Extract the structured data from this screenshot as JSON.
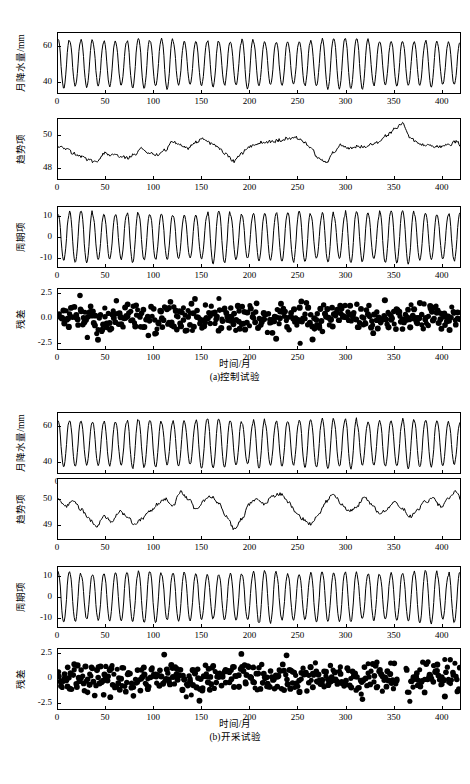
{
  "figure": {
    "subfigures": [
      {
        "id": "a",
        "caption": "(a)控制试验",
        "xaxis_title": "时间/月",
        "xticks": [
          "0",
          "50",
          "100",
          "150",
          "200",
          "250",
          "300",
          "350",
          "400"
        ],
        "xlim": [
          0,
          420
        ],
        "panels": [
          {
            "key": "precip",
            "ylabel": "月降水量/mm",
            "yticks": [
              "60",
              "40"
            ],
            "ytick_values": [
              60,
              40
            ],
            "ylim": [
              33,
              68
            ]
          },
          {
            "key": "trend",
            "ylabel": "趋势项",
            "yticks": [
              "50",
              "48"
            ],
            "ytick_values": [
              50,
              48
            ],
            "ylim": [
              47.3,
              51.0
            ]
          },
          {
            "key": "seasonal",
            "ylabel": "周期项",
            "yticks": [
              "10",
              "0",
              "-10"
            ],
            "ytick_values": [
              10,
              0,
              -10
            ],
            "ylim": [
              -15,
              15
            ]
          },
          {
            "key": "residual",
            "ylabel": "残差",
            "yticks": [
              "2.5",
              "0.0",
              "-2.5"
            ],
            "ytick_values": [
              2.5,
              0.0,
              -2.5
            ],
            "ylim": [
              -3.2,
              3.0
            ]
          }
        ]
      },
      {
        "id": "b",
        "caption": "(b)开采试验",
        "xaxis_title": "时间/月",
        "xticks": [
          "0",
          "50",
          "100",
          "150",
          "200",
          "250",
          "300",
          "350",
          "400"
        ],
        "xlim": [
          0,
          420
        ],
        "panels": [
          {
            "key": "precip",
            "ylabel": "月降水量/mm",
            "yticks": [
              "60",
              "40"
            ],
            "ytick_values": [
              60,
              40
            ],
            "ylim": [
              33,
              68
            ]
          },
          {
            "key": "trend",
            "ylabel": "趋势项",
            "yticks": [
              "50",
              "49"
            ],
            "ytick_values": [
              50,
              49
            ],
            "ylim": [
              48.4,
              50.8
            ]
          },
          {
            "key": "seasonal",
            "ylabel": "周期项",
            "yticks": [
              "10",
              "0",
              "-10"
            ],
            "ytick_values": [
              10,
              0,
              -10
            ],
            "ylim": [
              -15,
              15
            ]
          },
          {
            "key": "residual",
            "ylabel": "残差",
            "yticks": [
              "2.5",
              "0",
              "-2.5"
            ],
            "ytick_values": [
              2.5,
              0,
              -2.5
            ],
            "ylim": [
              -3.2,
              3.0
            ]
          }
        ]
      }
    ]
  },
  "chart_data": [
    {
      "type": "line",
      "id": "a-precip",
      "title": "",
      "xlabel": "时间/月",
      "ylabel": "月降水量/mm",
      "xlim": [
        0,
        420
      ],
      "ylim": [
        33,
        68
      ],
      "grid": false,
      "description": "Monthly precipitation series, control experiment: strong 12-month seasonal oscillation between about 37 and 65 mm, roughly 35 cycles.",
      "seasonal_period": 12,
      "series": [
        {
          "name": "月降水量",
          "amplitude": 13.5,
          "mean": 50.2,
          "cycles": 35,
          "min": 36.5,
          "max": 65.5
        }
      ]
    },
    {
      "type": "line",
      "id": "a-trend",
      "xlabel": "时间/月",
      "ylabel": "趋势项",
      "xlim": [
        0,
        420
      ],
      "ylim": [
        47.3,
        51.0
      ],
      "grid": false,
      "description": "Trend component, control experiment: fluctuates near 49-50 with a dip around month 35, rises to local peaks near 130 and a pronounced maximum near month 360.",
      "series": [
        {
          "name": "趋势项",
          "x": [
            0,
            8,
            16,
            24,
            32,
            40,
            48,
            56,
            64,
            72,
            80,
            88,
            96,
            104,
            112,
            120,
            128,
            136,
            144,
            152,
            160,
            168,
            176,
            184,
            192,
            200,
            208,
            216,
            224,
            232,
            240,
            248,
            256,
            264,
            272,
            280,
            288,
            296,
            304,
            312,
            320,
            328,
            336,
            344,
            352,
            360,
            368,
            376,
            384,
            392,
            400,
            408,
            416
          ],
          "values": [
            49.3,
            49.2,
            48.9,
            48.7,
            48.5,
            48.3,
            48.9,
            48.8,
            48.7,
            48.6,
            48.8,
            49.2,
            48.9,
            48.8,
            49.1,
            49.6,
            49.4,
            49.2,
            49.6,
            49.8,
            49.5,
            49.2,
            48.8,
            48.4,
            48.9,
            49.3,
            49.5,
            49.6,
            49.6,
            49.7,
            49.8,
            49.9,
            49.6,
            49.2,
            48.6,
            48.3,
            49.0,
            49.4,
            49.2,
            49.3,
            49.3,
            49.5,
            49.6,
            50.0,
            50.4,
            50.7,
            49.8,
            49.5,
            49.4,
            49.3,
            49.3,
            49.4,
            49.6
          ]
        }
      ]
    },
    {
      "type": "line",
      "id": "a-seasonal",
      "xlabel": "时间/月",
      "ylabel": "周期项",
      "xlim": [
        0,
        420
      ],
      "ylim": [
        -15,
        15
      ],
      "grid": false,
      "description": "Periodic (seasonal) component, control experiment: regular 12-month cycle oscillating between about -12 and +12.",
      "seasonal_period": 12,
      "series": [
        {
          "name": "周期项",
          "amplitude": 12,
          "mean": 0,
          "cycles": 35,
          "min": -12,
          "max": 12
        }
      ]
    },
    {
      "type": "scatter",
      "id": "a-residual",
      "xlabel": "时间/月",
      "ylabel": "残差",
      "xlim": [
        0,
        420
      ],
      "ylim": [
        -3.2,
        3.0
      ],
      "grid": false,
      "description": "Residual component, control experiment: dense cloud of about 420 points scattered around zero, mostly within ±1.5, a few outliers reaching ±2.5.",
      "n_points": 420,
      "spread": 0.85,
      "mean": 0
    },
    {
      "type": "line",
      "id": "b-precip",
      "xlabel": "时间/月",
      "ylabel": "月降水量/mm",
      "xlim": [
        0,
        420
      ],
      "ylim": [
        33,
        68
      ],
      "grid": false,
      "description": "Monthly precipitation series, extraction experiment: strong 12-month seasonal oscillation between about 37 and 65 mm, roughly 35 cycles.",
      "seasonal_period": 12,
      "series": [
        {
          "name": "月降水量",
          "amplitude": 13.5,
          "mean": 50.2,
          "cycles": 35,
          "min": 36.5,
          "max": 65.5
        }
      ]
    },
    {
      "type": "line",
      "id": "b-trend",
      "xlabel": "时间/月",
      "ylabel": "趋势项",
      "xlim": [
        0,
        420
      ],
      "ylim": [
        48.4,
        50.8
      ],
      "grid": false,
      "description": "Trend component, extraction experiment: noisier than control, oscillating between about 48.7 and 50.4 with a maximum near month 125 and a deep minimum near month 185.",
      "series": [
        {
          "name": "趋势项",
          "x": [
            0,
            8,
            16,
            24,
            32,
            40,
            48,
            56,
            64,
            72,
            80,
            88,
            96,
            104,
            112,
            120,
            128,
            136,
            144,
            152,
            160,
            168,
            176,
            184,
            192,
            200,
            208,
            216,
            224,
            232,
            240,
            248,
            256,
            264,
            272,
            280,
            288,
            296,
            304,
            312,
            320,
            328,
            336,
            344,
            352,
            360,
            368,
            376,
            384,
            392,
            400,
            408,
            416
          ],
          "values": [
            50.0,
            49.7,
            49.9,
            49.6,
            49.2,
            48.9,
            49.3,
            49.1,
            49.5,
            49.3,
            49.0,
            49.2,
            49.5,
            49.8,
            50.0,
            49.7,
            50.3,
            50.0,
            49.6,
            49.9,
            50.1,
            49.8,
            49.3,
            48.8,
            49.2,
            49.8,
            50.0,
            49.8,
            50.1,
            50.2,
            49.9,
            49.5,
            49.2,
            49.0,
            49.4,
            49.9,
            50.2,
            49.8,
            49.5,
            49.7,
            50.1,
            49.8,
            49.4,
            49.6,
            49.9,
            49.6,
            49.3,
            49.6,
            49.9,
            50.0,
            49.7,
            50.0,
            50.3
          ]
        }
      ]
    },
    {
      "type": "line",
      "id": "b-seasonal",
      "xlabel": "时间/月",
      "ylabel": "周期项",
      "xlim": [
        0,
        420
      ],
      "ylim": [
        -15,
        15
      ],
      "grid": false,
      "description": "Periodic (seasonal) component, extraction experiment: regular 12-month cycle oscillating between about -12 and +12.",
      "seasonal_period": 12,
      "series": [
        {
          "name": "周期项",
          "amplitude": 12,
          "mean": 0,
          "cycles": 35,
          "min": -12,
          "max": 12
        }
      ]
    },
    {
      "type": "scatter",
      "id": "b-residual",
      "xlabel": "时间/月",
      "ylabel": "残差",
      "xlim": [
        0,
        420
      ],
      "ylim": [
        -3.2,
        3.0
      ],
      "grid": false,
      "description": "Residual component, extraction experiment: dense cloud of about 420 points scattered around zero, mostly within ±1.5, with a visible gap near month 355.",
      "n_points": 420,
      "spread": 0.85,
      "mean": 0
    }
  ]
}
